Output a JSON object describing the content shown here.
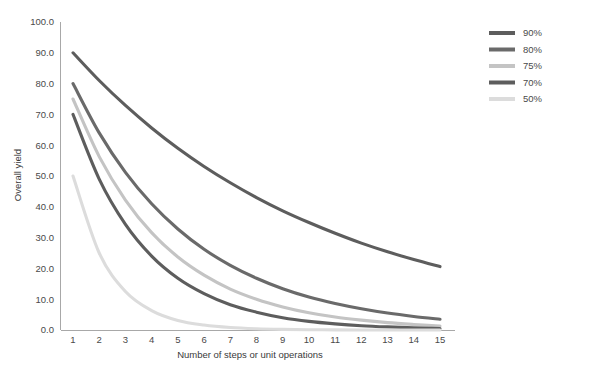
{
  "chart_data": {
    "type": "line",
    "title": "",
    "xlabel": "Number of steps or unit operations",
    "ylabel": "Overall yield",
    "xlim": [
      1,
      15
    ],
    "ylim": [
      0,
      100
    ],
    "grid": false,
    "legend_position": "top-right",
    "x": [
      1,
      2,
      3,
      4,
      5,
      6,
      7,
      8,
      9,
      10,
      11,
      12,
      13,
      14,
      15
    ],
    "xticklabels": [
      "1",
      "2",
      "3",
      "4",
      "5",
      "6",
      "7",
      "8",
      "9",
      "10",
      "11",
      "12",
      "13",
      "14",
      "15"
    ],
    "yticks": [
      0,
      10,
      20,
      30,
      40,
      50,
      60,
      70,
      80,
      90,
      100
    ],
    "yticklabels": [
      "0.0",
      "10.0",
      "20.0",
      "30.0",
      "40.0",
      "50.0",
      "60.0",
      "70.0",
      "80.0",
      "90.0",
      "100.0"
    ],
    "series": [
      {
        "name": "90%",
        "color": "#5d5d5d",
        "values": [
          90.0,
          81.0,
          72.9,
          65.6,
          59.0,
          53.1,
          47.8,
          43.0,
          38.7,
          34.9,
          31.4,
          28.2,
          25.4,
          22.9,
          20.6
        ]
      },
      {
        "name": "80%",
        "color": "#6a6a6a",
        "values": [
          80.0,
          64.0,
          51.2,
          41.0,
          32.8,
          26.2,
          21.0,
          16.8,
          13.4,
          10.7,
          8.6,
          6.9,
          5.5,
          4.4,
          3.5
        ]
      },
      {
        "name": "75%",
        "color": "#c4c4c4",
        "values": [
          75.0,
          56.3,
          42.2,
          31.6,
          23.7,
          17.8,
          13.3,
          10.0,
          7.5,
          5.6,
          4.2,
          3.2,
          2.4,
          1.8,
          1.3
        ]
      },
      {
        "name": "70%",
        "color": "#5d5d5d",
        "values": [
          70.0,
          49.0,
          34.3,
          24.0,
          16.8,
          11.8,
          8.2,
          5.8,
          4.0,
          2.8,
          2.0,
          1.4,
          1.0,
          0.7,
          0.5
        ]
      },
      {
        "name": "50%",
        "color": "#dcdcdc",
        "values": [
          50.0,
          25.0,
          12.5,
          6.3,
          3.1,
          1.6,
          0.8,
          0.4,
          0.2,
          0.1,
          0.05,
          0.02,
          0.01,
          0.01,
          0.0
        ]
      }
    ]
  },
  "legend": {
    "items": [
      {
        "label": "90%"
      },
      {
        "label": "80%"
      },
      {
        "label": "75%"
      },
      {
        "label": "70%"
      },
      {
        "label": "50%"
      }
    ]
  },
  "axes": {
    "x_title": "Number of steps or unit operations",
    "y_title": "Overall yield"
  }
}
